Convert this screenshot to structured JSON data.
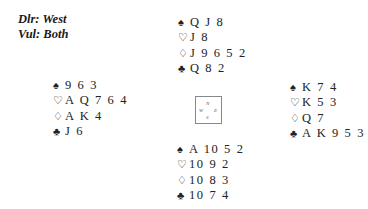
{
  "meta": {
    "dealer": "Dlr: West",
    "vulnerability": "Vul: Both"
  },
  "suits": {
    "spade": "♠",
    "heart": "♡",
    "diamond": "♢",
    "club": "♣"
  },
  "hands": {
    "north": {
      "spades": "Q J 8",
      "hearts": "J 8",
      "diamonds": "J 9 6 5 2",
      "clubs": "Q 8 2"
    },
    "west": {
      "spades": "9 6 3",
      "hearts": "A Q 7 6 4",
      "diamonds": "A K 4",
      "clubs": "J 6"
    },
    "east": {
      "spades": "K 7 4",
      "hearts": "K 5 3",
      "diamonds": "Q 7",
      "clubs": "A K 9 5 3"
    },
    "south": {
      "spades": "A 10 5 2",
      "hearts": "10 9 2",
      "diamonds": "10 8 3",
      "clubs": "10 7 4"
    }
  },
  "compass": {
    "n": "N",
    "w": "W",
    "e": "E",
    "s": "S"
  }
}
